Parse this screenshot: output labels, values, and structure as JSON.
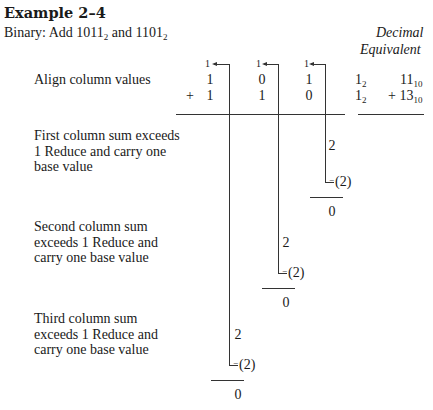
{
  "header": {
    "title": "Example 2–4",
    "subtitle_prefix": "Binary: Add ",
    "operand_a": "1011",
    "operand_b": "1101",
    "base_sub": "2",
    "and": " and "
  },
  "decimal_header": {
    "line1": "Decimal",
    "line2": "Equivalent"
  },
  "carries": [
    "1",
    "1",
    "1"
  ],
  "align_row": {
    "label": "Align column values",
    "row1": [
      "1",
      "0",
      "1",
      "1"
    ],
    "row2": [
      "1",
      "1",
      "0",
      "1"
    ],
    "plus": "+",
    "base_sub": "2",
    "decimal_row1": "11",
    "decimal_row2": "13",
    "decimal_plus": "+ ",
    "decimal_sub": "10"
  },
  "steps": [
    {
      "label": "First column sum exceeds 1 Reduce and carry one base value",
      "sum": "2",
      "subtract": "(2)",
      "minus": "−",
      "result": "0"
    },
    {
      "label": "Second column sum exceeds 1 Reduce and carry one base value",
      "sum": "2",
      "subtract": "(2)",
      "minus": "−",
      "result": "0"
    },
    {
      "label": "Third column sum exceeds 1 Reduce and carry one base value",
      "sum": "2",
      "subtract": "(2)",
      "minus": "−",
      "result": "0"
    }
  ]
}
